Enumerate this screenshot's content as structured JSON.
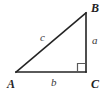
{
  "figure": {
    "type": "right-triangle-diagram",
    "width": 107,
    "height": 95,
    "background_color": "#ffffff",
    "stroke_color": "#232323",
    "label_color": "#232323",
    "side_label_color": "#3a3a3a"
  },
  "vertices": {
    "a": {
      "label": "A",
      "x": 16,
      "y": 72
    },
    "b": {
      "label": "B",
      "x": 86,
      "y": 13
    },
    "c": {
      "label": "C",
      "x": 86,
      "y": 72
    }
  },
  "sides": {
    "hypotenuse": {
      "label": "c",
      "from": "A",
      "to": "B"
    },
    "vertical": {
      "label": "a",
      "from": "B",
      "to": "C"
    },
    "base": {
      "label": "b",
      "from": "A",
      "to": "C"
    }
  },
  "markers": {
    "right_angle": {
      "name": "right-angle-marker",
      "at_vertex": "C",
      "size": 8
    }
  }
}
